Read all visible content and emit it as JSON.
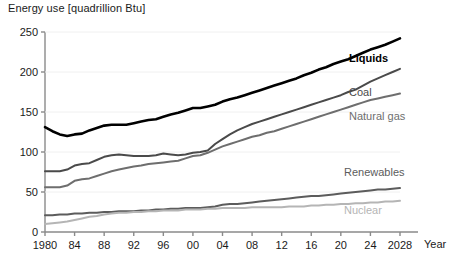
{
  "chart_data": {
    "type": "line",
    "title": "Energy use [quadrillion Btu]",
    "xlabel": "Year",
    "ylabel": "",
    "xlim": [
      1980,
      2028
    ],
    "ylim": [
      0,
      250
    ],
    "grid": false,
    "legend_position": "inline-right",
    "x_tick_labels": [
      "1980",
      "84",
      "88",
      "92",
      "96",
      "00",
      "04",
      "08",
      "12",
      "16",
      "20",
      "24",
      "2028"
    ],
    "x_ticks": [
      1980,
      1984,
      1988,
      1992,
      1996,
      2000,
      2004,
      2008,
      2012,
      2016,
      2020,
      2024,
      2028
    ],
    "y_ticks": [
      0,
      50,
      100,
      150,
      200,
      250
    ],
    "y_tick_labels": [
      "0",
      "50",
      "100",
      "150",
      "200",
      "250"
    ],
    "x": [
      1980,
      1981,
      1982,
      1983,
      1984,
      1985,
      1986,
      1987,
      1988,
      1989,
      1990,
      1991,
      1992,
      1993,
      1994,
      1995,
      1996,
      1997,
      1998,
      1999,
      2000,
      2001,
      2002,
      2003,
      2004,
      2005,
      2006,
      2007,
      2008,
      2009,
      2010,
      2011,
      2012,
      2013,
      2014,
      2015,
      2016,
      2017,
      2018,
      2019,
      2020,
      2021,
      2022,
      2023,
      2024,
      2025,
      2026,
      2027,
      2028
    ],
    "series": [
      {
        "name": "Liquids",
        "color": "#000000",
        "width": 2.6,
        "label_bold": true,
        "values": [
          131,
          126,
          122,
          120,
          122,
          123,
          127,
          130,
          133,
          134,
          134,
          134,
          136,
          138,
          140,
          141,
          144,
          147,
          149,
          152,
          155,
          155,
          157,
          159,
          163,
          166,
          168,
          171,
          174,
          177,
          180,
          183,
          186,
          189,
          192,
          196,
          199,
          203,
          206,
          210,
          213,
          216,
          220,
          224,
          228,
          231,
          234,
          238,
          242
        ]
      },
      {
        "name": "Coal",
        "color": "#4a4a4a",
        "width": 2.0,
        "label_bold": false,
        "values": [
          76,
          76,
          76,
          78,
          83,
          85,
          86,
          90,
          94,
          96,
          97,
          96,
          95,
          95,
          95,
          96,
          98,
          97,
          96,
          97,
          99,
          100,
          102,
          110,
          116,
          122,
          127,
          131,
          135,
          138,
          141,
          144,
          147,
          150,
          153,
          156,
          159,
          162,
          165,
          168,
          171,
          175,
          178,
          183,
          188,
          192,
          196,
          200,
          204
        ]
      },
      {
        "name": "Natural gas",
        "color": "#6e6e6e",
        "width": 2.0,
        "label_bold": false,
        "values": [
          56,
          56,
          56,
          58,
          64,
          66,
          67,
          70,
          73,
          76,
          78,
          80,
          82,
          83,
          85,
          86,
          87,
          88,
          89,
          92,
          95,
          96,
          99,
          103,
          107,
          110,
          113,
          116,
          119,
          121,
          124,
          126,
          129,
          132,
          135,
          138,
          141,
          144,
          147,
          150,
          153,
          156,
          159,
          162,
          165,
          167,
          169,
          171,
          173
        ]
      },
      {
        "name": "Renewables",
        "color": "#5c5c5c",
        "width": 2.0,
        "label_bold": false,
        "values": [
          21,
          21,
          22,
          22,
          23,
          23,
          24,
          24,
          25,
          25,
          26,
          26,
          26,
          27,
          27,
          28,
          28,
          29,
          29,
          30,
          30,
          30,
          31,
          32,
          34,
          35,
          35,
          36,
          37,
          38,
          39,
          40,
          41,
          42,
          43,
          44,
          45,
          45,
          46,
          47,
          48,
          49,
          50,
          51,
          52,
          53,
          53,
          54,
          55
        ]
      },
      {
        "name": "Nuclear",
        "color": "#b5b5b5",
        "width": 2.0,
        "label_bold": false,
        "values": [
          10,
          11,
          12,
          13,
          15,
          17,
          19,
          20,
          22,
          23,
          24,
          24,
          25,
          25,
          26,
          26,
          27,
          27,
          27,
          28,
          28,
          28,
          29,
          29,
          30,
          30,
          30,
          30,
          31,
          31,
          31,
          31,
          31,
          32,
          32,
          32,
          33,
          33,
          34,
          34,
          35,
          35,
          36,
          36,
          37,
          37,
          38,
          38,
          39
        ]
      }
    ],
    "series_labels": [
      {
        "name": "Liquids",
        "x": 349,
        "y": 62
      },
      {
        "name": "Coal",
        "x": 349,
        "y": 96
      },
      {
        "name": "Natural gas",
        "x": 349,
        "y": 120
      },
      {
        "name": "Renewables",
        "x": 344,
        "y": 176
      },
      {
        "name": "Nuclear",
        "x": 344,
        "y": 214
      }
    ]
  }
}
